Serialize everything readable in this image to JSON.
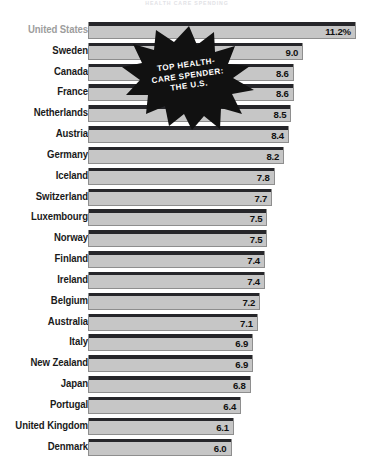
{
  "chart_data": {
    "type": "bar",
    "orientation": "horizontal",
    "title": "HEALTH CARE SPENDING",
    "xlabel": "",
    "ylabel": "",
    "xlim": [
      0,
      12.2
    ],
    "grid": false,
    "legend": null,
    "value_suffix_first": "%",
    "categories": [
      "United States",
      "Sweden",
      "Canada",
      "France",
      "Netherlands",
      "Austria",
      "Germany",
      "Iceland",
      "Switzerland",
      "Luxembourg",
      "Norway",
      "Finland",
      "Ireland",
      "Belgium",
      "Australia",
      "Italy",
      "New Zealand",
      "Japan",
      "Portugal",
      "United Kingdom",
      "Denmark",
      "Spain",
      "Greece"
    ],
    "values": [
      11.2,
      9.0,
      8.6,
      8.6,
      8.5,
      8.4,
      8.2,
      7.8,
      7.7,
      7.5,
      7.5,
      7.4,
      7.4,
      7.2,
      7.1,
      6.9,
      6.9,
      6.8,
      6.4,
      6.1,
      6.0,
      6.0,
      5.3
    ],
    "value_labels": [
      "11.2%",
      "9.0",
      "8.6",
      "8.6",
      "8.5",
      "8.4",
      "8.2",
      "7.8",
      "7.7",
      "7.5",
      "7.5",
      "7.4",
      "7.4",
      "7.2",
      "7.1",
      "6.9",
      "6.9",
      "6.8",
      "6.4",
      "6.1",
      "6.0",
      "6.0",
      "5.3"
    ],
    "highlight_category": "United States",
    "annotation": {
      "name": "starburst-callout",
      "lines": [
        "TOP HEALTH-",
        "CARE SPENDER:",
        "THE U.S."
      ]
    }
  },
  "colors": {
    "bar_fill": "#c6c6c6",
    "bar_top_shadow": "#26262a",
    "bar_border": "#8e8e8e",
    "label": "#1a1a1a",
    "label_highlight": "#9d9d9d",
    "background": "#ffffff",
    "burst_fill": "#111111",
    "burst_text": "#ffffff"
  }
}
